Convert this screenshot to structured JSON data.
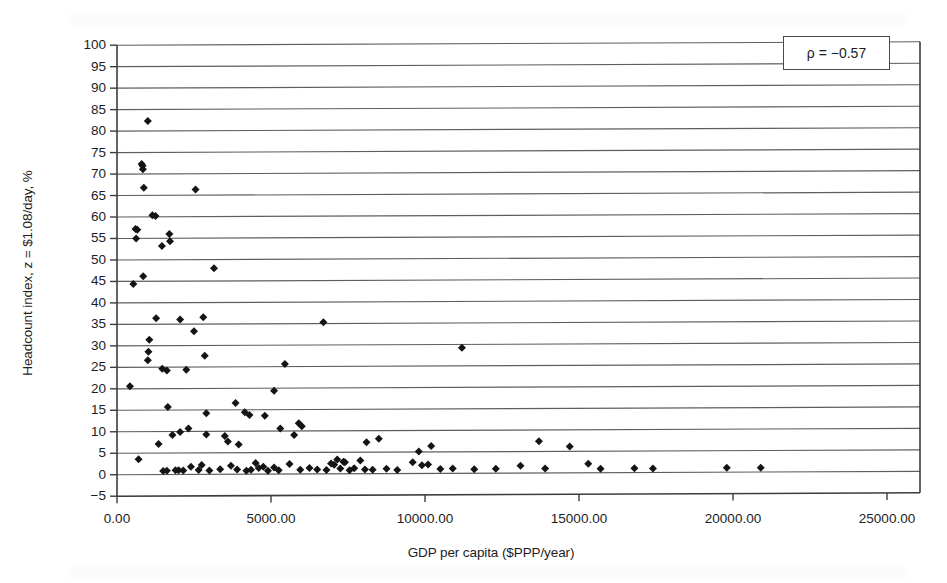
{
  "chart_data": {
    "type": "scatter",
    "title": "",
    "xlabel": "GDP per capita ($PPP/year)",
    "ylabel": "Headcount index, z = $1.08/day, %",
    "xlim": [
      0,
      25000
    ],
    "ylim": [
      -5,
      100
    ],
    "xticks": [
      0,
      5000,
      10000,
      15000,
      20000,
      25000
    ],
    "xtick_labels": [
      "0.00",
      "5000.00",
      "10000.00",
      "15000.00",
      "20000.00",
      "25000.00"
    ],
    "yticks": [
      -5,
      0,
      5,
      10,
      15,
      20,
      25,
      30,
      35,
      40,
      45,
      50,
      55,
      60,
      65,
      70,
      75,
      80,
      85,
      90,
      95,
      100
    ],
    "ytick_labels": [
      "−5",
      "0",
      "5",
      "10",
      "15",
      "20",
      "25",
      "30",
      "35",
      "40",
      "45",
      "50",
      "55",
      "60",
      "65",
      "70",
      "75",
      "80",
      "85",
      "90",
      "95",
      "100"
    ],
    "grid": "horizontal",
    "legend": "none",
    "marker": "diamond",
    "marker_color": "#141414",
    "annotations": [
      {
        "name": "correlation",
        "text": "ρ = −0.57",
        "x": 23000,
        "y": 95
      }
    ],
    "series": [
      {
        "name": "Countries",
        "points": [
          [
            1000,
            82.3
          ],
          [
            800,
            72.3
          ],
          [
            830,
            71.9
          ],
          [
            840,
            71.1
          ],
          [
            870,
            66.8
          ],
          [
            2550,
            66.3
          ],
          [
            1150,
            60.4
          ],
          [
            1250,
            60.2
          ],
          [
            600,
            57.2
          ],
          [
            660,
            57.0
          ],
          [
            620,
            55.0
          ],
          [
            1700,
            56.0
          ],
          [
            1720,
            54.3
          ],
          [
            1460,
            53.2
          ],
          [
            3150,
            48.0
          ],
          [
            850,
            46.2
          ],
          [
            530,
            44.4
          ],
          [
            1270,
            36.4
          ],
          [
            2050,
            36.1
          ],
          [
            2800,
            36.6
          ],
          [
            6700,
            35.3
          ],
          [
            2500,
            33.3
          ],
          [
            1050,
            31.4
          ],
          [
            1020,
            28.6
          ],
          [
            2850,
            27.6
          ],
          [
            1000,
            26.6
          ],
          [
            5450,
            25.6
          ],
          [
            1470,
            24.6
          ],
          [
            1620,
            24.2
          ],
          [
            2250,
            24.4
          ],
          [
            420,
            20.6
          ],
          [
            5100,
            19.4
          ],
          [
            11200,
            29.2
          ],
          [
            1650,
            15.7
          ],
          [
            4150,
            14.4
          ],
          [
            3850,
            16.6
          ],
          [
            4300,
            13.8
          ],
          [
            4800,
            13.6
          ],
          [
            2900,
            14.2
          ],
          [
            5900,
            11.8
          ],
          [
            6000,
            11.1
          ],
          [
            2320,
            10.7
          ],
          [
            1350,
            7.1
          ],
          [
            3500,
            8.9
          ],
          [
            3600,
            7.6
          ],
          [
            3950,
            6.9
          ],
          [
            2900,
            9.3
          ],
          [
            2050,
            9.9
          ],
          [
            1800,
            9.2
          ],
          [
            5300,
            10.6
          ],
          [
            5750,
            9.1
          ],
          [
            8100,
            7.3
          ],
          [
            8500,
            8.1
          ],
          [
            10200,
            6.4
          ],
          [
            9800,
            5.1
          ],
          [
            13700,
            7.4
          ],
          [
            14700,
            6.1
          ],
          [
            700,
            3.6
          ],
          [
            2000,
            1.0
          ],
          [
            2150,
            0.9
          ],
          [
            2400,
            1.8
          ],
          [
            3000,
            0.9
          ],
          [
            3350,
            1.2
          ],
          [
            3700,
            2.0
          ],
          [
            3900,
            1.1
          ],
          [
            4200,
            0.8
          ],
          [
            4350,
            1.0
          ],
          [
            4500,
            2.6
          ],
          [
            4600,
            1.4
          ],
          [
            4750,
            1.7
          ],
          [
            4900,
            0.8
          ],
          [
            5100,
            1.5
          ],
          [
            5250,
            0.9
          ],
          [
            5600,
            2.3
          ],
          [
            5950,
            1.0
          ],
          [
            6250,
            1.4
          ],
          [
            6500,
            1.0
          ],
          [
            6800,
            0.9
          ],
          [
            7050,
            2.1
          ],
          [
            7250,
            1.2
          ],
          [
            7400,
            2.7
          ],
          [
            7550,
            0.8
          ],
          [
            7700,
            1.3
          ],
          [
            7900,
            3.1
          ],
          [
            8050,
            1.0
          ],
          [
            8300,
            0.9
          ],
          [
            8750,
            1.1
          ],
          [
            9100,
            0.8
          ],
          [
            9600,
            2.6
          ],
          [
            9900,
            1.9
          ],
          [
            10100,
            2.1
          ],
          [
            10500,
            1.0
          ],
          [
            10900,
            1.1
          ],
          [
            11600,
            0.9
          ],
          [
            12300,
            1.0
          ],
          [
            13100,
            1.7
          ],
          [
            13900,
            1.0
          ],
          [
            15300,
            2.1
          ],
          [
            15700,
            0.9
          ],
          [
            16800,
            1.0
          ],
          [
            17400,
            0.9
          ],
          [
            19800,
            1.0
          ],
          [
            20900,
            1.0
          ],
          [
            1500,
            0.8
          ],
          [
            1620,
            0.9
          ],
          [
            1900,
            1.0
          ],
          [
            2650,
            1.0
          ],
          [
            2750,
            2.2
          ],
          [
            6950,
            2.4
          ],
          [
            7150,
            3.3
          ],
          [
            7350,
            2.8
          ]
        ]
      }
    ]
  },
  "axis": {
    "y_title": "Headcount index, z = $1.08/day, %",
    "x_title": "GDP per capita ($PPP/year)"
  },
  "annotation": {
    "rho_text": "ρ = −0.57"
  },
  "colors": {
    "marker": "#141414",
    "gridline": "#5e5e5e",
    "axis": "#3c3c3c",
    "background": "#ffffff"
  }
}
